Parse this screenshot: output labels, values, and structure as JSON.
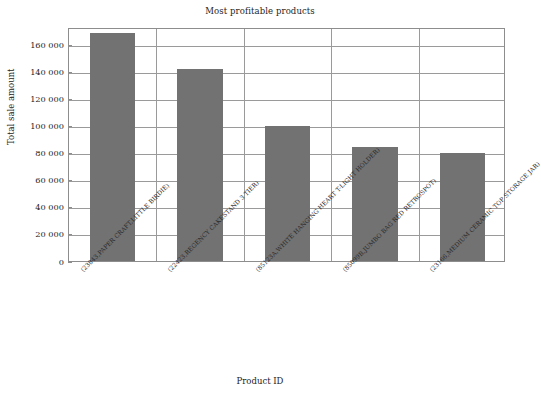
{
  "chart_data": {
    "type": "bar",
    "title": "Most profitable products",
    "xlabel": "Product ID",
    "ylabel": "Total sale amount",
    "categories": [
      "(23843,PAPER CRAFT,LITTLE BIRDIE)",
      "(22423,REGENCY CAKESTAND 3 TIER)",
      "(85123A,WHITE HANGING HEART T-LIGHT HOLDER)",
      "(85099B,JUMBO BAG RED RETROSPOT)",
      "(23166,MEDIUM CERAMIC TOP STORAGE JAR)"
    ],
    "values": [
      168470,
      142000,
      99500,
      84000,
      80000
    ],
    "ylim": [
      0,
      173000
    ],
    "yticks": [
      0,
      20000,
      40000,
      60000,
      80000,
      100000,
      120000,
      140000,
      160000
    ],
    "ytick_labels": [
      "0",
      "20 000",
      "40 000",
      "60 000",
      "80 000",
      "100 000",
      "120 000",
      "140 000",
      "160 000"
    ],
    "grid": true,
    "legend": false,
    "bar_color": "#727272",
    "frame_color": "#8d8d8d",
    "background": "#ffffff"
  }
}
